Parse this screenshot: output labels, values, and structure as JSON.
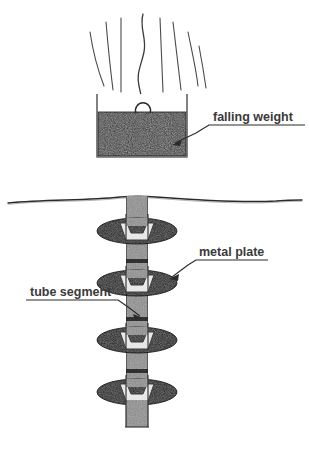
{
  "diagram": {
    "background_color": "#ffffff",
    "ink_color": "#2b2b2b",
    "labels": [
      {
        "id": "falling-weight",
        "text": "falling weight",
        "text_x": 213,
        "text_y": 121,
        "underline": {
          "x1": 209,
          "y1": 125,
          "x2": 305,
          "y2": 125
        },
        "leader": {
          "x1": 209,
          "y1": 125,
          "x2": 196,
          "y2": 133,
          "x3": 173,
          "y3": 144
        },
        "arrow_at": {
          "x": 173,
          "y": 144
        }
      },
      {
        "id": "metal-plate",
        "text": "metal plate",
        "text_x": 199,
        "text_y": 256,
        "underline": {
          "x1": 196,
          "y1": 260,
          "x2": 268,
          "y2": 260
        },
        "leader": {
          "x1": 196,
          "y1": 260,
          "x2": 188,
          "y2": 265,
          "x3": 170,
          "y3": 278
        },
        "arrow_at": {
          "x": 170,
          "y": 278
        }
      },
      {
        "id": "tube-segment",
        "text": "tube segment",
        "text_x": 30,
        "text_y": 296,
        "underline": {
          "x1": 26,
          "y1": 300,
          "x2": 118,
          "y2": 300
        },
        "leader": {
          "x1": 118,
          "y1": 300,
          "x2": 128,
          "y2": 307,
          "x3": 141,
          "y3": 317
        },
        "arrow_at": {
          "x": 141,
          "y": 317
        }
      }
    ],
    "weight": {
      "name": "falling-weight-block",
      "box_left": 97,
      "box_right": 187,
      "box_top": 94,
      "box_bottom": 157,
      "fill_top": 112,
      "fill_color": "#2a2a2a",
      "outline_color": "#555555",
      "eyelet": {
        "cx": 142,
        "cy": 109,
        "r": 7
      }
    },
    "motion_lines": {
      "name": "motion-speed-lines",
      "count": 7,
      "color": "#4a4a4a",
      "description": "curved speed lines fanning upward above the falling weight"
    },
    "cable": {
      "name": "wavy-cable",
      "description": "wavy vertical line from the eyelet going up off the top of the frame",
      "color": "#3a3a3a"
    },
    "ground": {
      "name": "ground-line",
      "y": 200,
      "x_start": 8,
      "x_end": 302,
      "color": "#2b2b2b",
      "description": "slightly undulating ground surface line across the full width"
    },
    "tube": {
      "name": "tube-column",
      "left": 126,
      "right": 148,
      "top": 196,
      "bottom": 427,
      "fill_color": "#8d8d8d",
      "edge_color": "#3a3a3a",
      "segment_joint_y": [
        262,
        320,
        372
      ],
      "segments": 4
    },
    "plates": [
      {
        "cx": 137,
        "cy": 231,
        "rx": 40,
        "ry": 13,
        "fill": "#141414"
      },
      {
        "cx": 137,
        "cy": 283,
        "rx": 40,
        "ry": 13,
        "fill": "#141414"
      },
      {
        "cx": 137,
        "cy": 340,
        "rx": 40,
        "ry": 13,
        "fill": "#141414"
      },
      {
        "cx": 137,
        "cy": 392,
        "rx": 40,
        "ry": 13,
        "fill": "#141414"
      }
    ],
    "collars": [
      {
        "cy": 231
      },
      {
        "cy": 283
      },
      {
        "cy": 340
      },
      {
        "cy": 392
      }
    ],
    "collar_fill": "#e8e8e8"
  }
}
